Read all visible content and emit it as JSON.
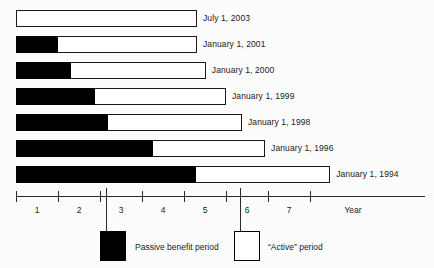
{
  "chart_data": {
    "type": "bar",
    "title": "",
    "subtitle": "",
    "xlabel": "Year",
    "ylabel": "",
    "xlim": [
      0,
      9.74
    ],
    "grid": false,
    "orientation": "horizontal",
    "stacked": true,
    "legend_position": "bottom",
    "xticks": [
      1,
      2,
      3,
      4,
      5,
      6,
      7
    ],
    "xtick_labels": [
      "1",
      "2",
      "3",
      "4",
      "5",
      "6",
      "7"
    ],
    "categories": [
      "July 1, 2003",
      "January 1, 2001",
      "January 1, 2000",
      "January 1, 1999",
      "January 1, 1998",
      "January 1, 1996",
      "January 1, 1994"
    ],
    "series": [
      {
        "name": "Passive benefit period",
        "color": "#000000",
        "values": [
          0.0,
          1.0,
          1.31,
          1.88,
          2.19,
          3.26,
          4.29
        ]
      },
      {
        "name": "“Active” period",
        "color": "#ffffff",
        "values": [
          4.31,
          3.31,
          3.21,
          3.12,
          3.19,
          2.67,
          3.19
        ]
      }
    ],
    "bar_totals": [
      4.31,
      4.31,
      4.52,
      5.0,
      5.38,
      5.93,
      7.48
    ],
    "legend": [
      {
        "label": "Passive benefit period",
        "swatch": "filled",
        "color": "#000000"
      },
      {
        "label": "“Active” period",
        "swatch": "hollow",
        "color": "#ffffff"
      }
    ],
    "annotations": [
      {
        "type": "leader-line",
        "x": 2.14,
        "target": "passive-legend-swatch"
      },
      {
        "type": "leader-line",
        "x": 5.33,
        "target": "active-legend-swatch"
      }
    ]
  }
}
